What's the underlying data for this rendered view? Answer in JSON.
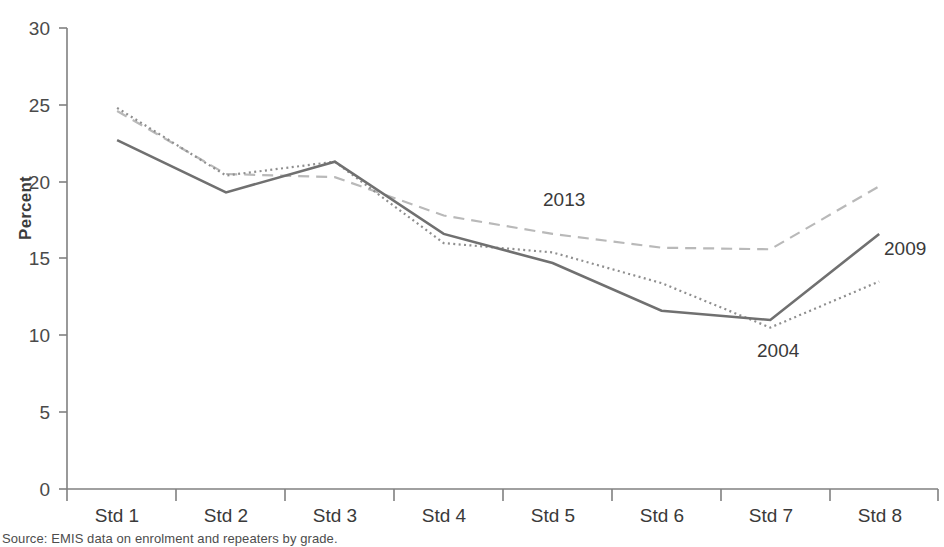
{
  "chart_data": {
    "type": "line",
    "title": "",
    "xlabel": "",
    "ylabel": "Percent",
    "categories": [
      "Std 1",
      "Std 2",
      "Std 3",
      "Std 4",
      "Std 5",
      "Std 6",
      "Std 7",
      "Std 8"
    ],
    "ylim": [
      0,
      30
    ],
    "yticks": [
      0,
      5,
      10,
      15,
      20,
      25,
      30
    ],
    "grid": false,
    "legend_position": "inline-annotations",
    "series": [
      {
        "name": "2004",
        "style": "dotted",
        "color": "#8c8c8c",
        "values": [
          24.8,
          20.4,
          21.3,
          16.0,
          15.4,
          13.4,
          10.5,
          13.5
        ]
      },
      {
        "name": "2009",
        "style": "solid",
        "color": "#6e6e6e",
        "values": [
          22.7,
          19.3,
          21.3,
          16.6,
          14.7,
          11.6,
          11.0,
          16.6
        ]
      },
      {
        "name": "2013",
        "style": "dashed",
        "color": "#b4b4b4",
        "values": [
          24.6,
          20.5,
          20.3,
          17.8,
          16.6,
          15.7,
          15.6,
          19.7
        ]
      }
    ],
    "annotations": [
      {
        "text": "2013",
        "series": "2013"
      },
      {
        "text": "2009",
        "series": "2009"
      },
      {
        "text": "2004",
        "series": "2004"
      }
    ]
  },
  "source": {
    "note": "Source: EMIS data on enrolment and repeaters by grade."
  }
}
